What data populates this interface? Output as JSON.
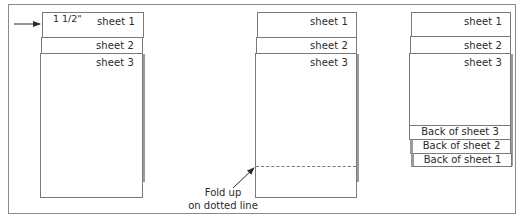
{
  "diagram": {
    "panel1": {
      "sheets": [
        "sheet 1",
        "sheet 2",
        "sheet 3"
      ],
      "measurement": "1 1/2\""
    },
    "panel2": {
      "sheets": [
        "sheet 1",
        "sheet 2",
        "sheet 3"
      ],
      "caption_line1": "Fold up",
      "caption_line2": "on dotted line"
    },
    "panel3": {
      "sheets": [
        "sheet 1",
        "sheet 2",
        "sheet 3"
      ],
      "backs": [
        "Back of sheet 3",
        "Back of sheet 2",
        "Back of sheet 1"
      ]
    },
    "colors": {
      "stroke": "#7a7a7a",
      "shadow": "#9a9a9a",
      "text": "#2a2a2a"
    }
  }
}
